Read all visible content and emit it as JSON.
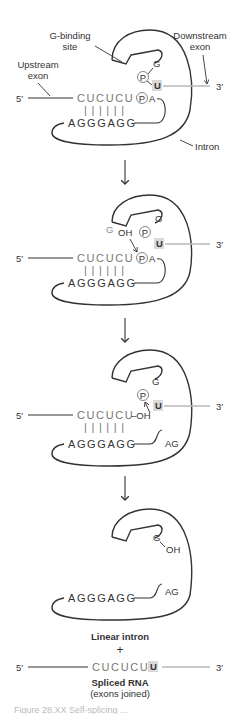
{
  "figure": {
    "colors": {
      "line": "#333333",
      "exon_sequence": "#777777",
      "downstream_exon_line": "#b8b8b8",
      "u_highlight": "#d9d9d9"
    },
    "labels": {
      "g_binding_site_line1": "G-binding",
      "g_binding_site_line2": "site",
      "downstream_exon_line1": "Downstream",
      "downstream_exon_line2": "exon",
      "upstream_exon_line1": "Upstream",
      "upstream_exon_line2": "exon",
      "intron": "Intron",
      "five_prime": "5′",
      "three_prime": "3′"
    },
    "panels": [
      {
        "upstream_seq": "CUCUCU",
        "intron_pair_seq": "AGGGAGG",
        "phosphate": "P",
        "a": "A",
        "g": "G",
        "u": "U",
        "base_pairs": "||||||"
      },
      {
        "upstream_seq": "CUCUCU",
        "intron_pair_seq": "AGGGAGG",
        "attacking_g": "G",
        "oh": "OH",
        "phosphate": "P",
        "a": "A",
        "g": "G",
        "u": "U",
        "base_pairs": "||||||"
      },
      {
        "upstream_seq": "CUCUCU",
        "oh_suffix": "–OH",
        "intron_pair_seq": "AGGGAGG",
        "intron_end": "AG",
        "phosphate": "P",
        "g": "G",
        "u": "U",
        "base_pairs": "||||||"
      },
      {
        "g": "G",
        "oh": "OH",
        "intron_pair_seq": "AGGGAGG",
        "intron_end": "AG"
      }
    ],
    "products": {
      "linear_intron": "Linear intron",
      "plus": "+",
      "spliced_seq": "CUCUCU",
      "spliced_u": "U",
      "spliced_rna": "Spliced RNA",
      "exons_joined": "(exons joined)"
    },
    "caption": "Figure 28.XX  Self-splicing ..."
  }
}
